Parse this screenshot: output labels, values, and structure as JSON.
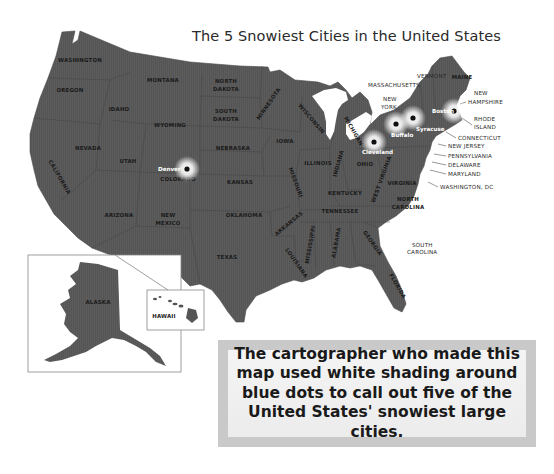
{
  "title": "The 5 Snowiest Cities in the United States",
  "map": {
    "fill_color": "#555555",
    "border_color": "#3c3c3c",
    "glow_color": "#ffffff",
    "dot_color": "#111111",
    "states": [
      {
        "label": "WASHINGTON",
        "x": 80,
        "y": 62,
        "rot": 0
      },
      {
        "label": "OREGON",
        "x": 70,
        "y": 92,
        "rot": 0
      },
      {
        "label": "IDAHO",
        "x": 119,
        "y": 111,
        "rot": 0
      },
      {
        "label": "MONTANA",
        "x": 163,
        "y": 82,
        "rot": 0
      },
      {
        "label": "WYOMING",
        "x": 170,
        "y": 127,
        "rot": 0
      },
      {
        "label": "NORTH",
        "x": 226,
        "y": 83,
        "rot": 0
      },
      {
        "label": "DAKOTA",
        "x": 226,
        "y": 91,
        "rot": 0
      },
      {
        "label": "SOUTH",
        "x": 226,
        "y": 113,
        "rot": 0
      },
      {
        "label": "DAKOTA",
        "x": 226,
        "y": 121,
        "rot": 0
      },
      {
        "label": "NEBRASKA",
        "x": 233,
        "y": 150,
        "rot": 0
      },
      {
        "label": "IOWA",
        "x": 285,
        "y": 143,
        "rot": 0
      },
      {
        "label": "MINNESOTA",
        "x": 270,
        "y": 105,
        "rot": -55
      },
      {
        "label": "WISCONSIN",
        "x": 310,
        "y": 120,
        "rot": 50
      },
      {
        "label": "MICHIGAN",
        "x": 352,
        "y": 132,
        "rot": 60
      },
      {
        "label": "NEVADA",
        "x": 88,
        "y": 150,
        "rot": 0
      },
      {
        "label": "UTAH",
        "x": 128,
        "y": 163,
        "rot": 0
      },
      {
        "label": "COLORADO",
        "x": 178,
        "y": 181,
        "rot": 0
      },
      {
        "label": "KANSAS",
        "x": 240,
        "y": 184,
        "rot": 0
      },
      {
        "label": "CALIFORNIA",
        "x": 58,
        "y": 178,
        "rot": 60
      },
      {
        "label": "ARIZONA",
        "x": 119,
        "y": 217,
        "rot": 0
      },
      {
        "label": "NEW",
        "x": 168,
        "y": 217,
        "rot": 0
      },
      {
        "label": "MEXICO",
        "x": 168,
        "y": 225,
        "rot": 0
      },
      {
        "label": "OKLAHOMA",
        "x": 244,
        "y": 217,
        "rot": 0
      },
      {
        "label": "TEXAS",
        "x": 227,
        "y": 259,
        "rot": 0
      },
      {
        "label": "MISSOURI",
        "x": 294,
        "y": 183,
        "rot": 70
      },
      {
        "label": "ILLINOIS",
        "x": 318,
        "y": 165,
        "rot": 0
      },
      {
        "label": "INDIANA",
        "x": 340,
        "y": 164,
        "rot": -75
      },
      {
        "label": "OHIO",
        "x": 365,
        "y": 166,
        "rot": 0
      },
      {
        "label": "WEST VIRGINIA",
        "x": 383,
        "y": 180,
        "rot": -70
      },
      {
        "label": "VIRGINIA",
        "x": 402,
        "y": 185,
        "rot": 0
      },
      {
        "label": "KENTUCKY",
        "x": 345,
        "y": 195,
        "rot": 0
      },
      {
        "label": "TENNESSEE",
        "x": 340,
        "y": 213,
        "rot": 0
      },
      {
        "label": "NORTH",
        "x": 408,
        "y": 201,
        "rot": 0
      },
      {
        "label": "CAROLINA",
        "x": 408,
        "y": 209,
        "rot": 0
      },
      {
        "label": "ARKANSAS",
        "x": 290,
        "y": 225,
        "rot": -40
      },
      {
        "label": "MISSISSIPPI",
        "x": 312,
        "y": 245,
        "rot": -80
      },
      {
        "label": "ALABAMA",
        "x": 338,
        "y": 243,
        "rot": -80
      },
      {
        "label": "GEORGIA",
        "x": 371,
        "y": 244,
        "rot": 55
      },
      {
        "label": "LOUISIANA",
        "x": 295,
        "y": 264,
        "rot": 55
      },
      {
        "label": "FLORIDA",
        "x": 396,
        "y": 287,
        "rot": 60
      },
      {
        "label": "MAINE",
        "x": 462,
        "y": 79,
        "rot": 0
      }
    ],
    "external_labels": [
      {
        "label": "VERMONT",
        "x": 417,
        "y": 78
      },
      {
        "label": "MASSACHUSETTS",
        "x": 368,
        "y": 87
      },
      {
        "label": "NEW",
        "x": 383,
        "y": 101
      },
      {
        "label": "YORK",
        "x": 381,
        "y": 109
      },
      {
        "label": "NEW",
        "x": 474,
        "y": 95
      },
      {
        "label": "HAMPSHIRE",
        "x": 468,
        "y": 104
      },
      {
        "label": "RHODE",
        "x": 474,
        "y": 121
      },
      {
        "label": "ISLAND",
        "x": 474,
        "y": 129
      },
      {
        "label": "CONNECTICUT",
        "x": 458,
        "y": 140
      },
      {
        "label": "NEW JERSEY",
        "x": 448,
        "y": 148
      },
      {
        "label": "PENNSYLVANIA",
        "x": 448,
        "y": 158
      },
      {
        "label": "DELAWARE",
        "x": 448,
        "y": 167
      },
      {
        "label": "MARYLAND",
        "x": 448,
        "y": 176
      },
      {
        "label": "WASHINGTON, DC",
        "x": 440,
        "y": 189
      },
      {
        "label": "SOUTH",
        "x": 412,
        "y": 247
      },
      {
        "label": "CAROLINA",
        "x": 407,
        "y": 254
      }
    ],
    "cities": [
      {
        "name": "Denver",
        "dot_x": 187,
        "dot_y": 169,
        "label_x": 158,
        "label_y": 171
      },
      {
        "name": "Cleveland",
        "dot_x": 374,
        "dot_y": 142,
        "label_x": 362,
        "label_y": 154
      },
      {
        "name": "Buffalo",
        "dot_x": 396,
        "dot_y": 124,
        "label_x": 391,
        "label_y": 137
      },
      {
        "name": "Syracuse",
        "dot_x": 413,
        "dot_y": 118,
        "label_x": 416,
        "label_y": 131
      },
      {
        "name": "Boston",
        "dot_x": 454,
        "dot_y": 111,
        "label_x": 432,
        "label_y": 113
      }
    ],
    "inset_alaska_label": "ALASKA",
    "inset_hawaii_label": "HAWAII"
  },
  "callout": {
    "lines": [
      "The cartographer who made this",
      "map used white shading around",
      "blue dots to call out five of the",
      "United States' snowiest large cities."
    ],
    "outer_color": "#c9c9c9",
    "inner_color": "#f2f2f2"
  }
}
